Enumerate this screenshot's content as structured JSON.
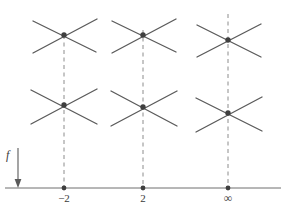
{
  "figure": {
    "background_color": "#ffffff",
    "ink_color": "#4a4a4a",
    "dash_color": "#8c8c8c",
    "width": 289,
    "height": 220
  },
  "axis": {
    "name": "horizontal-number-line",
    "y": 188,
    "x_start": 5,
    "x_end": 281,
    "stroke": "#6f6f6f",
    "stroke_width": 1,
    "ticks": [
      {
        "label": "−2",
        "x": 64
      },
      {
        "label": "2",
        "x": 143
      },
      {
        "label": "∞",
        "x": 228
      }
    ],
    "tick_label_y": 192
  },
  "arrow": {
    "name": "downward-arrow",
    "label": "f",
    "label_x": 8,
    "label_y": 150,
    "x": 18,
    "y_top": 148,
    "y_bottom": 187,
    "stroke": "#5a5a5a"
  },
  "columns": [
    {
      "name": "column-minus-two",
      "x": 64,
      "tick_label": "−2",
      "dash_top": 35,
      "dash_bottom": 188
    },
    {
      "name": "column-two",
      "x": 143,
      "tick_label": "2",
      "dash_top": 30,
      "dash_bottom": 188
    },
    {
      "name": "column-infinity",
      "x": 228,
      "tick_label": "∞",
      "dash_top": 14,
      "dash_bottom": 188
    }
  ],
  "nodes": [
    {
      "name": "node-minus-two-upper",
      "cx": 64,
      "cy": 35,
      "column": "−2",
      "row": "upper"
    },
    {
      "name": "node-minus-two-lower",
      "cx": 64,
      "cy": 105,
      "column": "−2",
      "row": "lower"
    },
    {
      "name": "node-two-upper",
      "cx": 143,
      "cy": 35,
      "column": "2",
      "row": "upper"
    },
    {
      "name": "node-two-lower",
      "cx": 143,
      "cy": 107,
      "column": "2",
      "row": "lower"
    },
    {
      "name": "node-infinity-upper",
      "cx": 228,
      "cy": 40,
      "column": "∞",
      "row": "upper"
    },
    {
      "name": "node-infinity-lower",
      "cx": 228,
      "cy": 113,
      "column": "∞",
      "row": "lower"
    }
  ],
  "node_style": {
    "dot_radius": 2.6,
    "dot_fill": "#3f3f3f",
    "spoke_stroke": "#5b5b5b",
    "spoke_width": 1.35,
    "spoke_length": 36,
    "spoke_angles_deg": [
      22,
      158,
      202,
      338
    ]
  },
  "spokes": [
    {
      "node": "node-minus-two-upper",
      "x1": 33,
      "y1": 21,
      "x2": 96,
      "y2": 52
    },
    {
      "node": "node-minus-two-upper",
      "x1": 33,
      "y1": 53,
      "x2": 97,
      "y2": 19
    },
    {
      "node": "node-minus-two-lower",
      "x1": 31,
      "y1": 90,
      "x2": 97,
      "y2": 124
    },
    {
      "node": "node-minus-two-lower",
      "x1": 31,
      "y1": 124,
      "x2": 97,
      "y2": 89
    },
    {
      "node": "node-two-upper",
      "x1": 112,
      "y1": 21,
      "x2": 176,
      "y2": 52
    },
    {
      "node": "node-two-upper",
      "x1": 112,
      "y1": 53,
      "x2": 176,
      "y2": 19
    },
    {
      "node": "node-two-lower",
      "x1": 111,
      "y1": 91,
      "x2": 177,
      "y2": 126
    },
    {
      "node": "node-two-lower",
      "x1": 111,
      "y1": 126,
      "x2": 177,
      "y2": 91
    },
    {
      "node": "node-infinity-upper",
      "x1": 197,
      "y1": 25,
      "x2": 261,
      "y2": 57
    },
    {
      "node": "node-infinity-upper",
      "x1": 197,
      "y1": 57,
      "x2": 261,
      "y2": 24
    },
    {
      "node": "node-infinity-lower",
      "x1": 196,
      "y1": 98,
      "x2": 262,
      "y2": 131
    },
    {
      "node": "node-infinity-lower",
      "x1": 196,
      "y1": 132,
      "x2": 262,
      "y2": 97
    }
  ]
}
